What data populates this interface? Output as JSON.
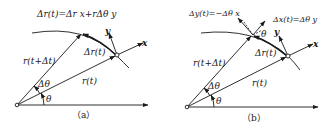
{
  "panels": [
    {
      "id": "a",
      "caption": "（a）",
      "equation": "Δr(t)=Δr x+rΔθ y",
      "labels": {
        "r_t": "r(t)",
        "r_t_dt": "r(t+Δt)",
        "delta_r": "Δr(t)",
        "delta_theta": "Δθ",
        "theta": "θ",
        "x_axis": "x",
        "y_axis": "y"
      }
    },
    {
      "id": "b",
      "caption": "（b）",
      "equation_left": "Δy(t)=−Δθ x",
      "equation_right": "Δx(t)=Δθ y",
      "labels": {
        "r_t": "r(t)",
        "r_t_dt": "r(t+Δt)",
        "delta_r": "Δr(t)",
        "delta_theta": "Δθ",
        "theta": "θ",
        "theta_small": "θ",
        "x_axis": "x",
        "y_axis": "y"
      }
    }
  ]
}
